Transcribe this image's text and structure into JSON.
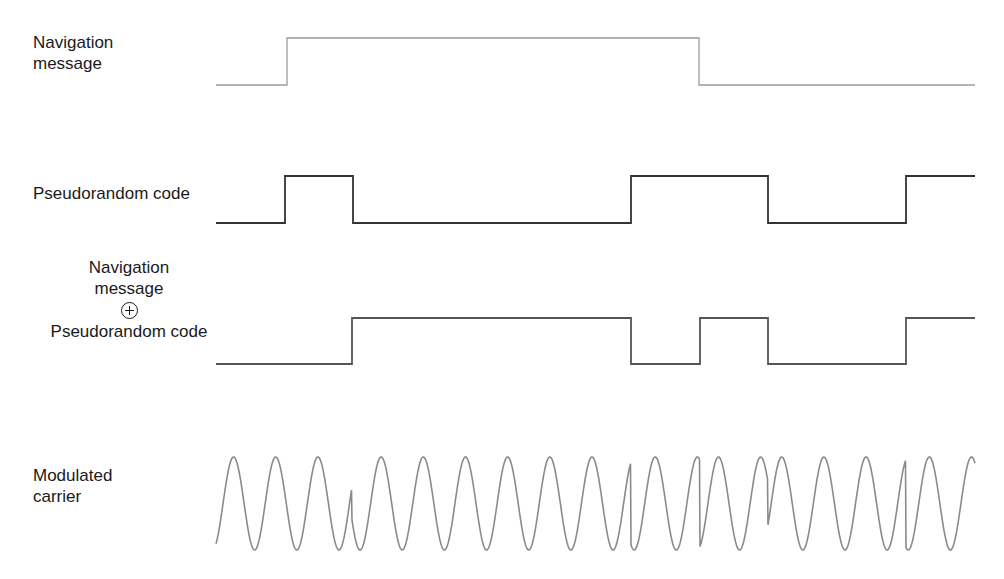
{
  "figure": {
    "rows": [
      {
        "id": "navigation-message",
        "label_lines": [
          "Navigation",
          "message"
        ],
        "signal_type": "square",
        "levels": [
          0,
          1,
          0
        ],
        "transitions_x": [
          216,
          287,
          699,
          975
        ],
        "y_high": 38,
        "y_low": 85,
        "stroke": "#9a9a9a"
      },
      {
        "id": "pseudorandom-code",
        "label_lines": [
          "Pseudorandom code"
        ],
        "signal_type": "square",
        "levels": [
          0,
          1,
          0,
          1,
          0,
          1
        ],
        "transitions_x": [
          216,
          285,
          353,
          631,
          768,
          906,
          975
        ],
        "y_high": 176,
        "y_low": 223,
        "stroke": "#333333"
      },
      {
        "id": "xor-result",
        "label_lines": [
          "Navigation",
          "message",
          "⊕",
          "Pseudorandom code"
        ],
        "operator_symbol": "circled-plus",
        "signal_type": "square",
        "levels": [
          0,
          1,
          0,
          1,
          0,
          1
        ],
        "transitions_x": [
          216,
          352,
          631,
          700,
          768,
          906,
          975
        ],
        "y_high": 318,
        "y_low": 364,
        "stroke": "#555555"
      },
      {
        "id": "modulated-carrier",
        "label_lines": [
          "Modulated",
          "carrier"
        ],
        "signal_type": "bpsk-carrier",
        "x_start": 216,
        "x_end": 975,
        "y_top": 457,
        "y_bottom": 550,
        "cycles_approx": 18,
        "phase_flips_x": [
          352,
          631,
          700,
          768,
          906
        ],
        "stroke": "#8a8a8a"
      }
    ]
  }
}
